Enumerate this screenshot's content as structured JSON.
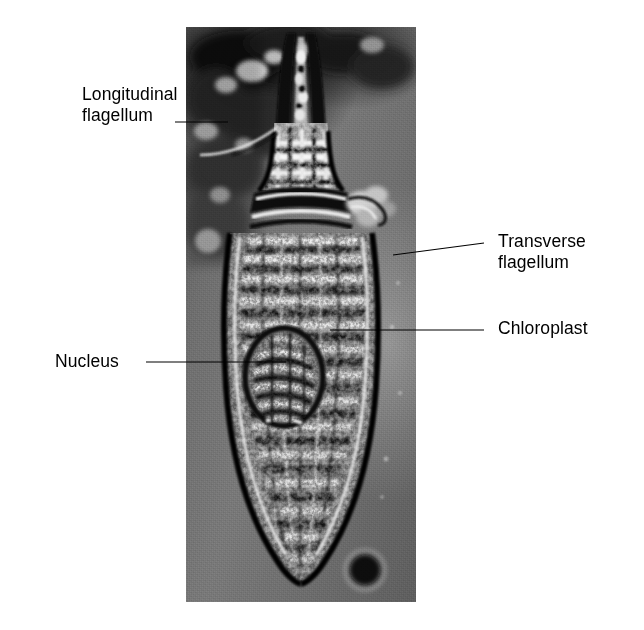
{
  "figure": {
    "type": "photomicrograph",
    "background_color": "#ffffff",
    "plate": {
      "x": 186,
      "y": 27,
      "width": 230,
      "height": 575,
      "tone_light": "#9a9a9a",
      "tone_mid": "#888888",
      "tone_dark": "#6f6f6f",
      "ink_black": "#0d0d0d",
      "ink_white": "#f2f2f2"
    }
  },
  "labels": [
    {
      "id": "longitudinal-flagellum",
      "text": "Longitudinal\nflagellum",
      "side": "left",
      "text_x": 82,
      "text_y": 84,
      "leader": {
        "x1": 175,
        "y1": 122,
        "x2": 228,
        "y2": 122
      }
    },
    {
      "id": "transverse-flagellum",
      "text": "Transverse\nflagellum",
      "side": "right",
      "text_x": 498,
      "text_y": 231,
      "leader": {
        "x1": 484,
        "y1": 243,
        "x2": 393,
        "y2": 255
      }
    },
    {
      "id": "chloroplast",
      "text": "Chloroplast",
      "side": "right",
      "text_x": 498,
      "text_y": 318,
      "leader": {
        "x1": 484,
        "y1": 330,
        "x2": 330,
        "y2": 330
      }
    },
    {
      "id": "nucleus",
      "text": "Nucleus",
      "side": "left",
      "text_x": 55,
      "text_y": 351,
      "leader": {
        "x1": 146,
        "y1": 362,
        "x2": 286,
        "y2": 362
      }
    }
  ],
  "leader_style": {
    "color": "#000000",
    "width": 1.2
  }
}
